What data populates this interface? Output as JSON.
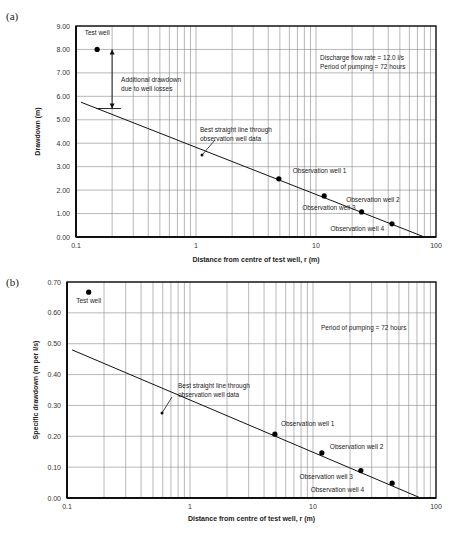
{
  "chart_data": [
    {
      "type": "scatter",
      "panel_label": "(a)",
      "title": "",
      "xlabel": "Distance from centre of test well, r (m)",
      "ylabel": "Drawdown (m)",
      "xscale": "log",
      "xlim": [
        0.1,
        100
      ],
      "ylim": [
        0,
        9
      ],
      "x_ticks": [
        "0.1",
        "1",
        "10",
        "100"
      ],
      "y_ticks": [
        "0.00",
        "1.00",
        "2.00",
        "3.00",
        "4.00",
        "5.00",
        "6.00",
        "7.00",
        "8.00",
        "9.00"
      ],
      "y_tick_values": [
        0,
        1,
        2,
        3,
        4,
        5,
        6,
        7,
        8,
        9
      ],
      "grid": true,
      "points": [
        {
          "name": "Test well",
          "x": 0.15,
          "y": 8.0
        },
        {
          "name": "Observation well 1",
          "x": 4.9,
          "y": 2.48
        },
        {
          "name": "Observation well 2",
          "x": 11.7,
          "y": 1.75
        },
        {
          "name": "Observation well 3",
          "x": 24,
          "y": 1.07
        },
        {
          "name": "Observation well 4",
          "x": 43,
          "y": 0.56
        }
      ],
      "fit_line": {
        "name": "Best straight line through observation well data",
        "x": [
          0.11,
          80
        ],
        "y": [
          5.75,
          0.0
        ]
      },
      "annotations": {
        "info_lines": [
          "Discharge flow rate = 12.0 l/s",
          "Period of pumping = 72 hours"
        ],
        "well_loss_lines": [
          "Additional drawdown",
          "due to well losses"
        ],
        "fit_label_lines": [
          "Best straight line through",
          "observation well data"
        ],
        "well_loss_arrow": {
          "x": 0.2,
          "y_from": 5.48,
          "y_to": 8.0
        }
      }
    },
    {
      "type": "scatter",
      "panel_label": "(b)",
      "title": "",
      "xlabel": "Distance from centre of test well, r (m)",
      "ylabel": "Specific drawdown (m per l/s)",
      "xscale": "log",
      "xlim": [
        0.1,
        100
      ],
      "ylim": [
        0,
        0.7
      ],
      "x_ticks": [
        "0.1",
        "1",
        "10",
        "100"
      ],
      "y_ticks": [
        "0.00",
        "0.10",
        "0.20",
        "0.30",
        "0.40",
        "0.50",
        "0.60",
        "0.70"
      ],
      "y_tick_values": [
        0,
        0.1,
        0.2,
        0.3,
        0.4,
        0.5,
        0.6,
        0.7
      ],
      "grid": true,
      "points": [
        {
          "name": "Test well",
          "x": 0.15,
          "y": 0.667
        },
        {
          "name": "Observation well 1",
          "x": 4.9,
          "y": 0.207
        },
        {
          "name": "Observation well 2",
          "x": 11.8,
          "y": 0.146
        },
        {
          "name": "Observation well 3",
          "x": 24.5,
          "y": 0.089
        },
        {
          "name": "Observation well 4",
          "x": 44,
          "y": 0.048
        }
      ],
      "fit_line": {
        "name": "Best straight line through observation well data",
        "x": [
          0.11,
          75
        ],
        "y": [
          0.48,
          0.0
        ]
      },
      "annotations": {
        "info_lines": [
          "Period of pumping = 72 hours"
        ],
        "fit_label_lines": [
          "Best straight line through",
          "observation well data"
        ]
      }
    }
  ]
}
